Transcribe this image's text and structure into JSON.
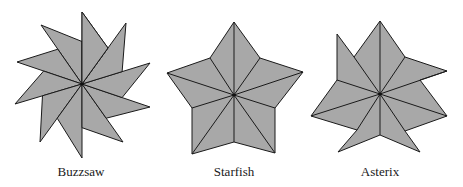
{
  "figures": [
    {
      "id": "buzzsaw",
      "label": "Buzzsaw",
      "label_x": 81,
      "center": [
        82,
        84
      ],
      "tips": [
        [
          82,
          12
        ],
        [
          126,
          23
        ],
        [
          150,
          63
        ],
        [
          150,
          107
        ],
        [
          123,
          142
        ],
        [
          82,
          158
        ],
        [
          40,
          142
        ],
        [
          15,
          104
        ],
        [
          17,
          62
        ],
        [
          41,
          25
        ]
      ],
      "blades": 10
    },
    {
      "id": "starfish",
      "label": "Starfish",
      "label_x": 234,
      "center": [
        234,
        95
      ],
      "outline": [
        [
          234,
          22
        ],
        [
          260,
          58
        ],
        [
          303,
          72
        ],
        [
          275,
          108
        ],
        [
          275,
          153
        ],
        [
          234,
          142
        ],
        [
          192,
          154
        ],
        [
          192,
          108
        ],
        [
          167,
          73
        ],
        [
          210,
          58
        ]
      ]
    },
    {
      "id": "asterix",
      "label": "Asterix",
      "label_x": 380,
      "center": [
        380,
        94
      ],
      "outline": [
        [
          380,
          21
        ],
        [
          405,
          57
        ],
        [
          447,
          71
        ],
        [
          420,
          80
        ],
        [
          447,
          116
        ],
        [
          405,
          131
        ],
        [
          420,
          152
        ],
        [
          380,
          135
        ],
        [
          338,
          152
        ],
        [
          357,
          130
        ],
        [
          311,
          116
        ],
        [
          337,
          80
        ],
        [
          337,
          34
        ],
        [
          354,
          57
        ]
      ],
      "radials": [
        [
          380,
          21
        ],
        [
          405,
          57
        ],
        [
          447,
          71
        ],
        [
          447,
          116
        ],
        [
          405,
          131
        ],
        [
          380,
          135
        ],
        [
          357,
          130
        ],
        [
          311,
          116
        ],
        [
          337,
          80
        ],
        [
          354,
          57
        ]
      ]
    }
  ],
  "colors": {
    "fill": "#a8a8a8",
    "stroke": "#1a1a1a"
  }
}
